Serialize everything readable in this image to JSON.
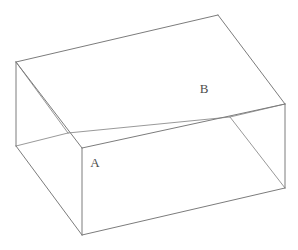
{
  "figure": {
    "type": "line-drawing",
    "projection": "oblique-perspective",
    "background_color": "#ffffff",
    "edge_color": "#7c7c7c",
    "label_color": "#4d4d4d",
    "canvas": {
      "width": 298,
      "height": 250
    },
    "labels": [
      {
        "id": "A",
        "text": "A",
        "x": 95,
        "y": 164
      },
      {
        "id": "B",
        "text": "B",
        "x": 204,
        "y": 90
      }
    ],
    "vertices": {
      "top_back_left": {
        "x": 16,
        "y": 62
      },
      "top_back_right": {
        "x": 218,
        "y": 15
      },
      "top_front_right": {
        "x": 285,
        "y": 104
      },
      "top_front_left": {
        "x": 82,
        "y": 148
      },
      "inner_back_left": {
        "x": 68,
        "y": 133
      },
      "inner_back_right": {
        "x": 230,
        "y": 117
      },
      "left_bottom": {
        "x": 16,
        "y": 146
      },
      "front_bottom": {
        "x": 82,
        "y": 235
      },
      "right_bottom": {
        "x": 285,
        "y": 188
      }
    },
    "edges": [
      {
        "name": "rim-back-left",
        "d": "M 16,62 L 218,15"
      },
      {
        "name": "rim-right",
        "d": "M 218,15 L 285,104"
      },
      {
        "name": "rim-front",
        "d": "M 285,104 L 82,148"
      },
      {
        "name": "rim-left",
        "d": "M 82,148 L 16,62"
      },
      {
        "name": "interior-floor-left",
        "d": "M 16,62 L 68,133"
      },
      {
        "name": "interior-floor-back",
        "d": "M 68,133 L 230,117"
      },
      {
        "name": "interior-floor-right",
        "d": "M 230,117 L 285,104"
      },
      {
        "name": "wall-left-vertical",
        "d": "M 16,62 L 16,146"
      },
      {
        "name": "wall-front-vertical",
        "d": "M 82,148 L 82,235"
      },
      {
        "name": "wall-right-vertical",
        "d": "M 285,104 L 285,188"
      },
      {
        "name": "base-left-front",
        "d": "M 16,146 L 82,235"
      },
      {
        "name": "base-front-right",
        "d": "M 82,235 L 285,188"
      },
      {
        "name": "base-left-to-inner",
        "d": "M 16,146 L 68,133"
      },
      {
        "name": "inner-wall-diagonal",
        "d": "M 230,117 L 285,188"
      }
    ],
    "faces": [
      {
        "name": "rim-top-quad",
        "points": "16,62 218,15 285,104 82,148"
      },
      {
        "name": "outer-left-face",
        "points": "16,62 82,148 82,235 16,146"
      },
      {
        "name": "outer-front-face",
        "points": "82,148 285,104 285,188 82,235"
      }
    ]
  }
}
